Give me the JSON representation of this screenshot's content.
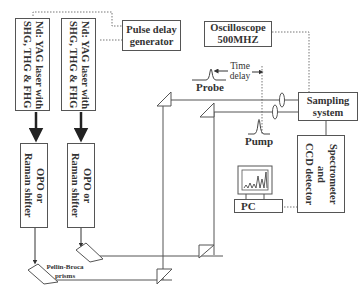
{
  "diagram": {
    "lasers": [
      {
        "label": "Nd: YAG laser with\nSHG, THG & FHG"
      },
      {
        "label": "Nd: YAG laser with\nSHG, THG & FHG"
      }
    ],
    "shifters": [
      {
        "label": "OPO or\nRaman shifter"
      },
      {
        "label": "OPO or\nRaman shifter"
      }
    ],
    "pulse_delay": {
      "label": "Pulse delay\ngenerator"
    },
    "oscilloscope": {
      "label": "Oscilloscope\n500MHZ"
    },
    "sampling": {
      "label": "Sampling\nsystem"
    },
    "spectrometer": {
      "label": "Spectrometer\nand\nCCD detector"
    },
    "pc": {
      "label": "PC"
    },
    "prisms": {
      "label": "Pellin-Broca\nprisms"
    },
    "probe": {
      "label": "Probe"
    },
    "pump": {
      "label": "Pump"
    },
    "time_delay": {
      "label": "Time\ndelay"
    }
  }
}
